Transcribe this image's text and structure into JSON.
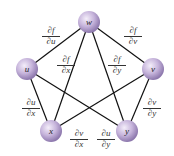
{
  "nodes": [
    {
      "id": "w",
      "label": "w",
      "x": 89,
      "y": 22
    },
    {
      "id": "u",
      "label": "u",
      "x": 27,
      "y": 69
    },
    {
      "id": "v",
      "label": "v",
      "x": 153,
      "y": 69
    },
    {
      "id": "x",
      "label": "x",
      "x": 51,
      "y": 131
    },
    {
      "id": "y",
      "label": "y",
      "x": 127,
      "y": 131
    }
  ],
  "edges": [
    {
      "from": "w",
      "to": "u"
    },
    {
      "from": "w",
      "to": "v"
    },
    {
      "from": "w",
      "to": "x"
    },
    {
      "from": "w",
      "to": "y"
    },
    {
      "from": "u",
      "to": "x"
    },
    {
      "from": "u",
      "to": "y"
    },
    {
      "from": "v",
      "to": "x"
    },
    {
      "from": "v",
      "to": "y"
    }
  ],
  "labels": {
    "df_du": {
      "num": "∂f",
      "den": "∂u"
    },
    "df_dv": {
      "num": "∂f",
      "den": "∂v"
    },
    "df_dx": {
      "num": "∂f",
      "den": "∂x"
    },
    "df_dy": {
      "num": "∂f",
      "den": "∂y"
    },
    "du_dx": {
      "num": "∂u",
      "den": "∂x"
    },
    "dv_dy": {
      "num": "∂v",
      "den": "∂y"
    },
    "dv_dx": {
      "num": "∂v",
      "den": "∂x"
    },
    "du_dy": {
      "num": "∂u",
      "den": "∂y"
    }
  },
  "colors": {
    "node_fill": "#c8b8dc",
    "node_edge": "#8a78a8",
    "line": "#111111"
  }
}
